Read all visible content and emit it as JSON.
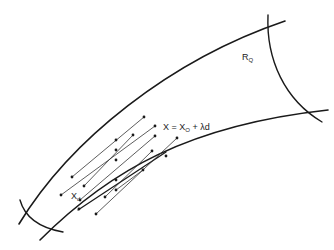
{
  "labels": {
    "region": {
      "main": "R",
      "sub": "Q"
    },
    "equation": {
      "x": "X",
      "eq": "=",
      "x0": "X",
      "x0_sub": "O",
      "plus": "+",
      "lambda_d": "λd"
    },
    "start_point": {
      "main": "X",
      "sub": "d"
    }
  },
  "colors": {
    "stroke": "#1a1a1a",
    "background": "#ffffff"
  }
}
